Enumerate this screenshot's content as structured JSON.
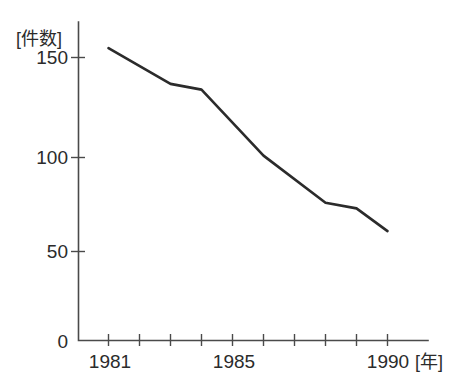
{
  "chart_data": {
    "type": "line",
    "title": "",
    "xlabel": "[年]",
    "ylabel": "[件数]",
    "x": [
      1981,
      1983,
      1984,
      1986,
      1988,
      1989,
      1990
    ],
    "values": [
      155,
      136,
      133,
      98,
      73,
      70,
      58
    ],
    "series": [
      {
        "name": "件数",
        "x": [
          1981,
          1983,
          1984,
          1986,
          1988,
          1989,
          1990
        ],
        "values": [
          155,
          136,
          133,
          98,
          73,
          70,
          58
        ]
      }
    ],
    "xlim": [
      1980.05,
      1991.3
    ],
    "ylim": [
      0,
      160
    ],
    "ytick_labels": [
      "0",
      "50",
      "100",
      "150"
    ],
    "ytick_values": [
      0,
      50,
      100,
      150
    ],
    "xtick_values": [
      1981,
      1982,
      1983,
      1984,
      1985,
      1986,
      1987,
      1988,
      1989,
      1990
    ],
    "xtick_labels_shown": [
      "1981",
      "1985",
      "1990"
    ],
    "xtick_labeled_values": [
      1981,
      1985,
      1990
    ],
    "grid": false,
    "legend": false,
    "line_color": "#2b2b2b",
    "axis_color": "#4a4a4a",
    "background": "#ffffff"
  },
  "labels": {
    "y_unit": "[件数]",
    "x_unit": "[年]",
    "y_0": "0",
    "y_50": "50",
    "y_100": "100",
    "y_150": "150",
    "x_1981": "1981",
    "x_1985": "1985",
    "x_1990": "1990"
  }
}
